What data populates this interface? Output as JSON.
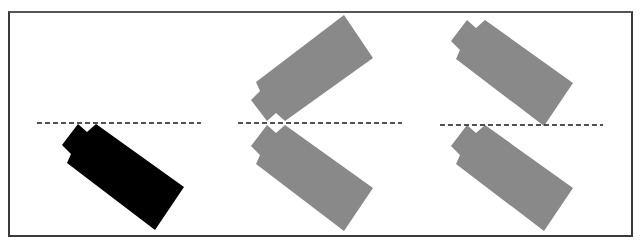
{
  "diagram": {
    "frame": {
      "x": 8,
      "y": 11,
      "width": 625,
      "height": 226,
      "stroke": "#3a3a3a"
    },
    "colors": {
      "original": "#000000",
      "transformed": "#898989",
      "dashed_line": "#1a1a1a",
      "background": "#ffffff"
    },
    "base_shape_points": [
      [
        78,
        124
      ],
      [
        87,
        132
      ],
      [
        96,
        124
      ],
      [
        184,
        187
      ],
      [
        155,
        230
      ],
      [
        67,
        163
      ],
      [
        71,
        154
      ],
      [
        62,
        145
      ]
    ],
    "panels": [
      {
        "name": "original",
        "dashed_line": {
          "x1": 37,
          "x2": 201,
          "y": 123
        },
        "shapes": [
          {
            "name": "original-block",
            "fill": "#000000",
            "dx": 0,
            "dy": 0,
            "mirror_y": false
          }
        ]
      },
      {
        "name": "reflection",
        "dashed_line": {
          "x1": 238,
          "x2": 402,
          "y": 123
        },
        "shapes": [
          {
            "name": "reflected-block-upper",
            "fill": "#898989",
            "dx": 189,
            "dy": 1,
            "mirror_y": true
          },
          {
            "name": "image-block-lower",
            "fill": "#898989",
            "dx": 189,
            "dy": 1,
            "mirror_y": false
          }
        ]
      },
      {
        "name": "translation",
        "dashed_line": {
          "x1": 440,
          "x2": 603,
          "y": 125
        },
        "shapes": [
          {
            "name": "translated-block-upper",
            "fill": "#898989",
            "dx": 389,
            "dy": -104,
            "mirror_y": false
          },
          {
            "name": "image-block-lower",
            "fill": "#898989",
            "dx": 389,
            "dy": 1,
            "mirror_y": false
          }
        ]
      }
    ]
  }
}
